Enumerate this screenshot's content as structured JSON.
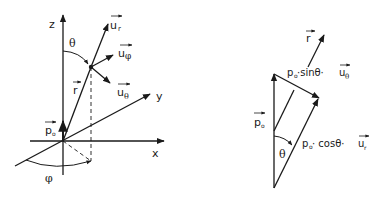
{
  "left_diagram": {
    "axes": {
      "z": "z",
      "y": "y",
      "x": "x"
    },
    "vectors": {
      "u_r": {
        "base": "u",
        "sub": "r"
      },
      "u_phi": {
        "base": "u",
        "sub": "φ"
      },
      "u_theta": {
        "base": "u",
        "sub": "θ"
      },
      "r": {
        "base": "r"
      },
      "p0": {
        "base": "p",
        "sub": "o"
      }
    },
    "angles": {
      "theta": "θ",
      "phi": "φ"
    }
  },
  "right_diagram": {
    "vectors": {
      "r": {
        "base": "r"
      },
      "p0": {
        "base": "p",
        "sub": "o"
      }
    },
    "labels": {
      "sin_component": {
        "prefix": "p",
        "prefix_sub": "o",
        "middle": "·sinθ·",
        "vec": "u",
        "vec_sub": "θ"
      },
      "cos_component": {
        "prefix": "p",
        "prefix_sub": "o",
        "middle": " · cosθ·",
        "vec": "u",
        "vec_sub": "r"
      }
    },
    "angles": {
      "theta": "θ"
    }
  },
  "colors": {
    "ink": "#1a1a1a",
    "background": "#ffffff"
  }
}
